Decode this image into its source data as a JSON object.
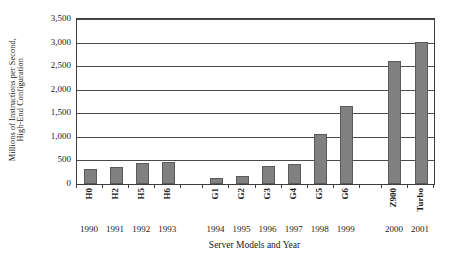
{
  "chart_data": {
    "type": "bar",
    "title": "",
    "subtitle": "",
    "xlabel": "Server Models and Year",
    "ylabel_line1": "Millions of Instructions per Second,",
    "ylabel_line2": "High-End Configuration",
    "categories": [
      "H0",
      "H2",
      "H5",
      "H6",
      "G1",
      "G2",
      "G3",
      "G4",
      "G5",
      "G6",
      "Z900",
      "Turbo"
    ],
    "years": [
      "1990",
      "1991",
      "1992",
      "1993",
      "1994",
      "1995",
      "1996",
      "1997",
      "1998",
      "1999",
      "2000",
      "2001"
    ],
    "values": [
      320,
      370,
      440,
      470,
      120,
      175,
      390,
      420,
      1070,
      1650,
      2600,
      3020
    ],
    "ylim": [
      0,
      3500
    ],
    "ytick_values": [
      0,
      500,
      1000,
      1500,
      2000,
      2500,
      3000,
      3500
    ],
    "ytick_labels": [
      "0",
      "500",
      "1,000",
      "1,500",
      "2,000",
      "2,500",
      "3,000",
      "3,500"
    ],
    "grid": true,
    "grid_axis": "y",
    "legend": false,
    "legend_position": "none",
    "bar_color": "#808080",
    "bar_border_color": "#5a5a5a",
    "axis_color": "#3c3c3c",
    "gridline_color": "#4a4a4a",
    "background_color": "#ffffff",
    "group_gap_after_index": [
      3,
      9
    ],
    "series": [
      {
        "name": "MIPS high-end configuration",
        "values": [
          320,
          370,
          440,
          470,
          120,
          175,
          390,
          420,
          1070,
          1650,
          2600,
          3020
        ]
      }
    ]
  }
}
